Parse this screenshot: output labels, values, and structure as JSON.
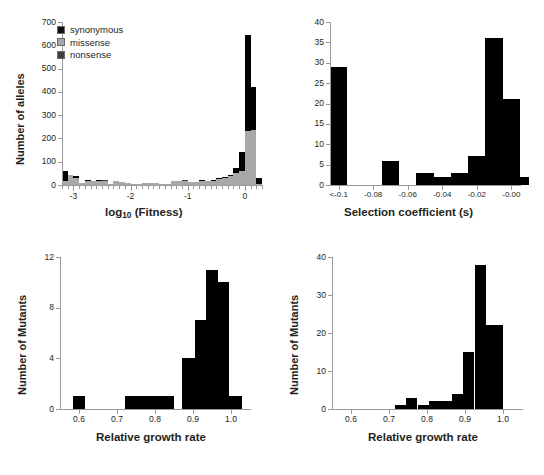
{
  "figure": {
    "caption_fragment": ""
  },
  "panels": [
    {
      "id": "panel-fitness",
      "ylabel": "Number of alleles",
      "xlabel_pre": "log",
      "xlabel_sub": "10",
      "xlabel_post": " (Fitness)",
      "legend": [
        {
          "key": "syn",
          "label": "synonymous",
          "color": "#111111"
        },
        {
          "key": "mis",
          "label": "missense",
          "color": "#a8a8a8"
        },
        {
          "key": "non",
          "label": "nonsense",
          "color": "#404040"
        }
      ],
      "yticks": [
        "0",
        "100",
        "200",
        "300",
        "400",
        "500",
        "600",
        "700"
      ],
      "xticks": [
        "-3",
        "-2",
        "-1",
        "0"
      ]
    },
    {
      "id": "panel-selection",
      "ylabel": "Number of alleles",
      "xlabel": "Selection coefficient (s)",
      "yticks": [
        "0",
        "5",
        "10",
        "15",
        "20",
        "25",
        "30",
        "35",
        "40"
      ],
      "xticks": [
        "<-0.1",
        "-0.08",
        "-0.06",
        "-0.04",
        "-0.02",
        "-0.00"
      ]
    },
    {
      "id": "panel-growth-left",
      "ylabel": "Number of Mutants",
      "xlabel": "Relative growth rate",
      "yticks": [
        "0",
        "4",
        "8",
        "12"
      ],
      "xticks": [
        "0.6",
        "0.7",
        "0.8",
        "0.9",
        "1.0"
      ]
    },
    {
      "id": "panel-growth-right",
      "ylabel": "Number of Mutants",
      "xlabel": "Relative growth rate",
      "yticks": [
        "0",
        "10",
        "20",
        "30",
        "40"
      ],
      "xticks": [
        "0.6",
        "0.7",
        "0.8",
        "0.9",
        "1.0"
      ]
    }
  ],
  "chart_data": [
    {
      "type": "bar",
      "id": "panel-fitness",
      "title": "",
      "xlabel": "log10 (Fitness)",
      "ylabel": "Number of alleles",
      "xlim": [
        -3.2,
        0.3
      ],
      "ylim": [
        0,
        700
      ],
      "grid": false,
      "stacked": true,
      "legend_position": "top-left",
      "legend": [
        "synonymous",
        "missense",
        "nonsense"
      ],
      "bin_width": 0.1,
      "bin_starts": [
        -3.2,
        -3.1,
        -3.0,
        -2.9,
        -2.8,
        -2.7,
        -2.6,
        -2.5,
        -2.4,
        -2.3,
        -2.2,
        -2.1,
        -2.0,
        -1.9,
        -1.8,
        -1.7,
        -1.6,
        -1.5,
        -1.4,
        -1.3,
        -1.2,
        -1.1,
        -1.0,
        -0.9,
        -0.8,
        -0.7,
        -0.6,
        -0.5,
        -0.4,
        -0.3,
        -0.2,
        -0.1,
        0.0,
        0.1,
        0.2
      ],
      "series": [
        {
          "name": "missense",
          "color": "#a8a8a8",
          "values": [
            18,
            44,
            32,
            10,
            20,
            18,
            20,
            16,
            6,
            16,
            12,
            8,
            6,
            6,
            8,
            10,
            8,
            4,
            6,
            18,
            16,
            18,
            14,
            14,
            18,
            16,
            20,
            28,
            32,
            40,
            52,
            60,
            230,
            235,
            6
          ]
        },
        {
          "name": "nonsense",
          "color": "#404040",
          "values": [
            0,
            0,
            0,
            0,
            0,
            0,
            0,
            4,
            0,
            0,
            0,
            0,
            0,
            0,
            0,
            0,
            0,
            0,
            0,
            0,
            0,
            4,
            0,
            0,
            0,
            0,
            0,
            0,
            0,
            0,
            0,
            0,
            0,
            0,
            0
          ]
        },
        {
          "name": "synonymous",
          "color": "#111111",
          "values": [
            44,
            0,
            8,
            0,
            2,
            0,
            2,
            0,
            0,
            0,
            0,
            0,
            0,
            0,
            0,
            0,
            0,
            0,
            0,
            0,
            0,
            0,
            0,
            0,
            2,
            0,
            2,
            4,
            4,
            4,
            22,
            80,
            415,
            185,
            26
          ]
        }
      ]
    },
    {
      "type": "bar",
      "id": "panel-selection",
      "title": "",
      "xlabel": "Selection coefficient (s)",
      "ylabel": "Number of alleles",
      "xlim": [
        -0.105,
        0.005
      ],
      "ylim": [
        0,
        40
      ],
      "grid": false,
      "bin_width": 0.01,
      "categories": [
        "<-0.1",
        "-0.09",
        "-0.08",
        "-0.07",
        "-0.06",
        "-0.05",
        "-0.04",
        "-0.03",
        "-0.02",
        "-0.01",
        "-0.00"
      ],
      "values": [
        29,
        0,
        0,
        6,
        0,
        3,
        2,
        3,
        7,
        36,
        21,
        2
      ],
      "bin_starts": [
        -0.105,
        -0.095,
        -0.085,
        -0.075,
        -0.065,
        -0.055,
        -0.045,
        -0.035,
        -0.025,
        -0.015,
        -0.005,
        0.0
      ]
    },
    {
      "type": "bar",
      "id": "panel-growth-left",
      "title": "",
      "xlabel": "Relative growth rate",
      "ylabel": "Number of Mutants",
      "xlim": [
        0.55,
        1.05
      ],
      "ylim": [
        0,
        12
      ],
      "grid": false,
      "bin_width": 0.025,
      "bin_starts": [
        0.585,
        0.725,
        0.75,
        0.775,
        0.8,
        0.825,
        0.875,
        0.9,
        0.925,
        0.95,
        0.975,
        1.0
      ],
      "values": [
        1,
        1,
        1,
        1,
        1,
        1,
        4,
        7,
        11,
        10,
        1
      ],
      "bins": [
        {
          "start": 0.585,
          "end": 0.615,
          "value": 1
        },
        {
          "start": 0.72,
          "end": 0.85,
          "value": 1
        },
        {
          "start": 0.87,
          "end": 0.905,
          "value": 4
        },
        {
          "start": 0.905,
          "end": 0.935,
          "value": 7
        },
        {
          "start": 0.935,
          "end": 0.965,
          "value": 11
        },
        {
          "start": 0.965,
          "end": 0.995,
          "value": 10
        },
        {
          "start": 0.995,
          "end": 1.03,
          "value": 1
        }
      ]
    },
    {
      "type": "bar",
      "id": "panel-growth-right",
      "title": "",
      "xlabel": "Relative growth rate",
      "ylabel": "Number of Mutants",
      "xlim": [
        0.55,
        1.05
      ],
      "ylim": [
        0,
        40
      ],
      "grid": false,
      "bin_width": 0.03,
      "bins": [
        {
          "start": 0.715,
          "end": 0.745,
          "value": 1
        },
        {
          "start": 0.745,
          "end": 0.775,
          "value": 3
        },
        {
          "start": 0.775,
          "end": 0.805,
          "value": 1
        },
        {
          "start": 0.805,
          "end": 0.835,
          "value": 2
        },
        {
          "start": 0.835,
          "end": 0.865,
          "value": 2
        },
        {
          "start": 0.865,
          "end": 0.895,
          "value": 4
        },
        {
          "start": 0.895,
          "end": 0.925,
          "value": 15
        },
        {
          "start": 0.925,
          "end": 0.955,
          "value": 38
        },
        {
          "start": 0.955,
          "end": 1.0,
          "value": 22
        }
      ]
    }
  ]
}
